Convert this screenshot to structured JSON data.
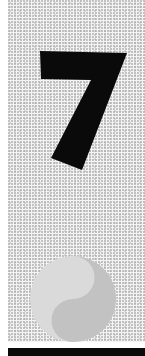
{
  "artwork": {
    "numeral": "7",
    "numeral_color": "#0a0a0a",
    "background_color": "#f4f4f4",
    "stipple_color": "#9a9a9a",
    "symbol": "yin-yang",
    "symbol_light_color": "#dadada",
    "symbol_dark_color": "#c2c2c2",
    "footer_bar_color": "#0a0a0a"
  }
}
